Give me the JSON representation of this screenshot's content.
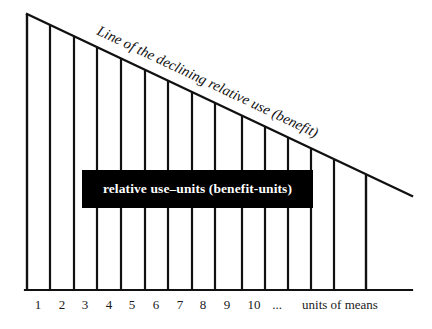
{
  "figure": {
    "title_on_line": "Line of the declining relative use (benefit)",
    "callout_label": "relative use–units (benefit-units)",
    "x_axis_caption": "units of means",
    "x_axis_ellipsis": "...",
    "colors": {
      "ink": "#111111",
      "callout_background": "#000000",
      "callout_text": "#ffffff",
      "page_background": "#ffffff"
    }
  },
  "chart_data": {
    "type": "bar",
    "title": "Line of the declining relative use (benefit)",
    "xlabel": "units of means",
    "ylabel": "relative use–units (benefit-units)",
    "categories": [
      "1",
      "2",
      "3",
      "4",
      "5",
      "6",
      "7",
      "8",
      "9",
      "10",
      "..."
    ],
    "values": [
      96,
      89,
      83,
      76,
      70,
      63,
      57,
      50,
      44,
      37,
      25
    ],
    "xlim": [
      0,
      12
    ],
    "ylim": [
      0,
      100
    ],
    "grid": false,
    "legend": null,
    "annotations": [
      {
        "text": "Line of the declining relative use (benefit)",
        "placement": "along-declining-line",
        "rotation_deg": 25.3
      },
      {
        "text": "relative use–units (benefit-units)",
        "placement": "centered-black-box"
      }
    ],
    "tick_labels": [
      "1",
      "2",
      "3",
      "4",
      "5",
      "6",
      "7",
      "8",
      "9",
      "10",
      "...",
      "units of means"
    ]
  },
  "x_ticks": [
    {
      "label": "1",
      "x": 38
    },
    {
      "label": "2",
      "x": 62
    },
    {
      "label": "3",
      "x": 85
    },
    {
      "label": "4",
      "x": 109
    },
    {
      "label": "5",
      "x": 132
    },
    {
      "label": "6",
      "x": 156
    },
    {
      "label": "7",
      "x": 180
    },
    {
      "label": "8",
      "x": 203
    },
    {
      "label": "9",
      "x": 227
    },
    {
      "label": "10",
      "x": 254
    },
    {
      "label": "...",
      "x": 277
    },
    {
      "label": "units of means",
      "x": 340
    }
  ],
  "geometry": {
    "line_start": {
      "x": 27,
      "y": 14
    },
    "line_end": {
      "x": 412,
      "y": 196
    },
    "baseline_y": 290,
    "verticals_x": [
      27,
      50,
      74,
      97,
      121,
      145,
      168,
      192,
      215,
      242,
      265,
      288,
      311,
      334,
      366
    ]
  }
}
